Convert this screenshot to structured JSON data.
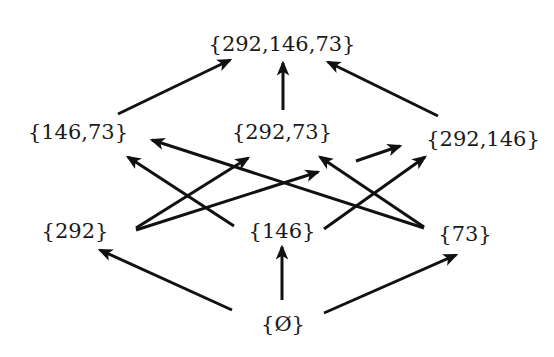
{
  "diagram": {
    "type": "hasse-diagram",
    "colors": {
      "stroke": "#111111",
      "text": "#1a1a1a",
      "background": "#ffffff"
    },
    "nodes": [
      {
        "id": "top",
        "label": "{292,146,73}",
        "x": 282,
        "y": 45
      },
      {
        "id": "n146_73",
        "label": "{146,73}",
        "x": 78,
        "y": 133
      },
      {
        "id": "n292_73",
        "label": "{292,73}",
        "x": 282,
        "y": 133
      },
      {
        "id": "n292_146",
        "label": "{292,146}",
        "x": 483,
        "y": 140
      },
      {
        "id": "n292",
        "label": "{292}",
        "x": 75,
        "y": 232
      },
      {
        "id": "n146",
        "label": "{146}",
        "x": 282,
        "y": 232
      },
      {
        "id": "n73",
        "label": "{73}",
        "x": 465,
        "y": 235
      },
      {
        "id": "empty",
        "label": "{Ø}",
        "x": 283,
        "y": 325
      }
    ],
    "edges": [
      {
        "from": "empty",
        "to": "n292",
        "x1": 232,
        "y1": 310,
        "x2": 100,
        "y2": 250
      },
      {
        "from": "empty",
        "to": "n146",
        "x1": 282,
        "y1": 300,
        "x2": 282,
        "y2": 247
      },
      {
        "from": "empty",
        "to": "n73",
        "x1": 324,
        "y1": 313,
        "x2": 456,
        "y2": 255
      },
      {
        "from": "n292",
        "to": "n292_73",
        "x1": 136,
        "y1": 228,
        "x2": 248,
        "y2": 158
      },
      {
        "from": "n292",
        "to": "n292_146",
        "x1": 136,
        "y1": 230,
        "x2": 318,
        "y2": 172
      },
      {
        "from": "n146",
        "to": "n146_73",
        "x1": 234,
        "y1": 226,
        "x2": 128,
        "y2": 157
      },
      {
        "from": "n146",
        "to": "n292_146",
        "x1": 324,
        "y1": 229,
        "x2": 425,
        "y2": 157
      },
      {
        "from": "n73",
        "to": "n146_73",
        "x1": 424,
        "y1": 228,
        "x2": 152,
        "y2": 140
      },
      {
        "from": "n73",
        "to": "n292_73",
        "x1": 424,
        "y1": 227,
        "x2": 320,
        "y2": 157
      },
      {
        "from": "n292_146_lead",
        "to": "n292_146",
        "x1": 356,
        "y1": 161,
        "x2": 400,
        "y2": 146
      },
      {
        "from": "n146_73",
        "to": "top",
        "x1": 118,
        "y1": 114,
        "x2": 230,
        "y2": 60
      },
      {
        "from": "n292_73",
        "to": "top",
        "x1": 283,
        "y1": 110,
        "x2": 283,
        "y2": 63
      },
      {
        "from": "n292_146",
        "to": "top",
        "x1": 438,
        "y1": 116,
        "x2": 328,
        "y2": 62
      }
    ]
  }
}
